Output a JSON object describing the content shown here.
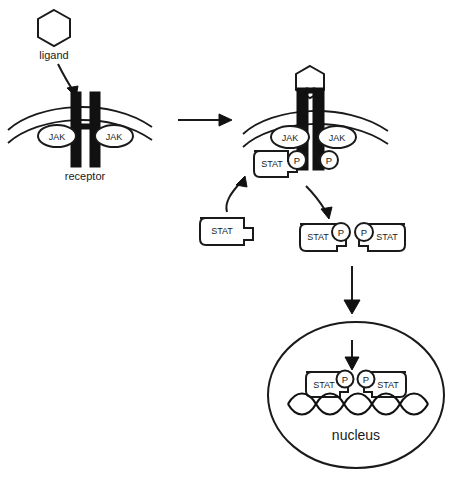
{
  "diagram": {
    "labels": {
      "ligand": "ligand",
      "receptor": "receptor",
      "nucleus": "nucleus",
      "jak": "JAK",
      "stat": "STAT",
      "phosphate": "P"
    },
    "colors": {
      "stroke": "#1a1a1a",
      "receptor_fill": "#111111",
      "background": "#ffffff",
      "shape_fill": "#ffffff"
    },
    "stages": [
      {
        "id": "inactive-receptor",
        "ligand_label": "ligand",
        "receptor_label": "receptor",
        "jak_labels": [
          "JAK",
          "JAK"
        ]
      },
      {
        "id": "activated-receptor",
        "jak_labels": [
          "JAK",
          "JAK"
        ],
        "phosphate_labels": [
          "P",
          "P"
        ],
        "stat_label": "STAT"
      },
      {
        "id": "free-stat",
        "stat_label": "STAT"
      },
      {
        "id": "stat-dimer",
        "stat_labels": [
          "STAT",
          "STAT"
        ],
        "phosphate_labels": [
          "P",
          "P"
        ]
      },
      {
        "id": "nucleus-dimer",
        "nucleus_label": "nucleus",
        "stat_labels": [
          "STAT",
          "STAT"
        ],
        "phosphate_labels": [
          "P",
          "P"
        ]
      }
    ]
  }
}
